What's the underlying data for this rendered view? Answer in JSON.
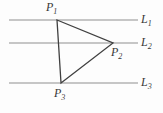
{
  "diagram": {
    "background": "#fdfdfd",
    "line_color": "#8f8f8f",
    "triangle_color": "#404040",
    "label_color": "#383838",
    "parallel_lines": [
      {
        "label": "L",
        "sub": "1",
        "y": 20,
        "x1": 9,
        "x2": 138
      },
      {
        "label": "L",
        "sub": "2",
        "y": 43,
        "x1": 9,
        "x2": 138
      },
      {
        "label": "L",
        "sub": "3",
        "y": 83,
        "x1": 9,
        "x2": 138
      }
    ],
    "points": [
      {
        "label": "P",
        "sub": "1",
        "x": 57,
        "y": 20
      },
      {
        "label": "P",
        "sub": "2",
        "x": 113,
        "y": 43
      },
      {
        "label": "P",
        "sub": "3",
        "x": 61,
        "y": 83
      }
    ],
    "triangle_vertices": [
      [
        57,
        20
      ],
      [
        113,
        43
      ],
      [
        61,
        83
      ]
    ]
  }
}
